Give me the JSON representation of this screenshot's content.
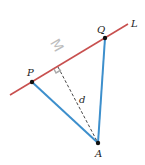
{
  "diagram": {
    "type": "geometry",
    "line": {
      "label": "L",
      "color": "#c8504f",
      "from": [
        10,
        95
      ],
      "to": [
        128,
        24
      ]
    },
    "points": [
      {
        "id": "P",
        "label": "P",
        "x": 32,
        "y": 82
      },
      {
        "id": "Q",
        "label": "Q",
        "x": 105,
        "y": 38
      },
      {
        "id": "A",
        "label": "A",
        "x": 98,
        "y": 143
      },
      {
        "id": "foot",
        "label": "",
        "x": 58,
        "y": 67
      }
    ],
    "segments": [
      {
        "from": "P",
        "to": "A",
        "color": "#3d8fcc",
        "style": "solid"
      },
      {
        "from": "Q",
        "to": "A",
        "color": "#3d8fcc",
        "style": "solid"
      },
      {
        "from": "foot",
        "to": "A",
        "color": "#333333",
        "style": "dashed"
      }
    ],
    "distance_label": "d",
    "ghost_mark": "M",
    "right_angle_marker": true
  }
}
